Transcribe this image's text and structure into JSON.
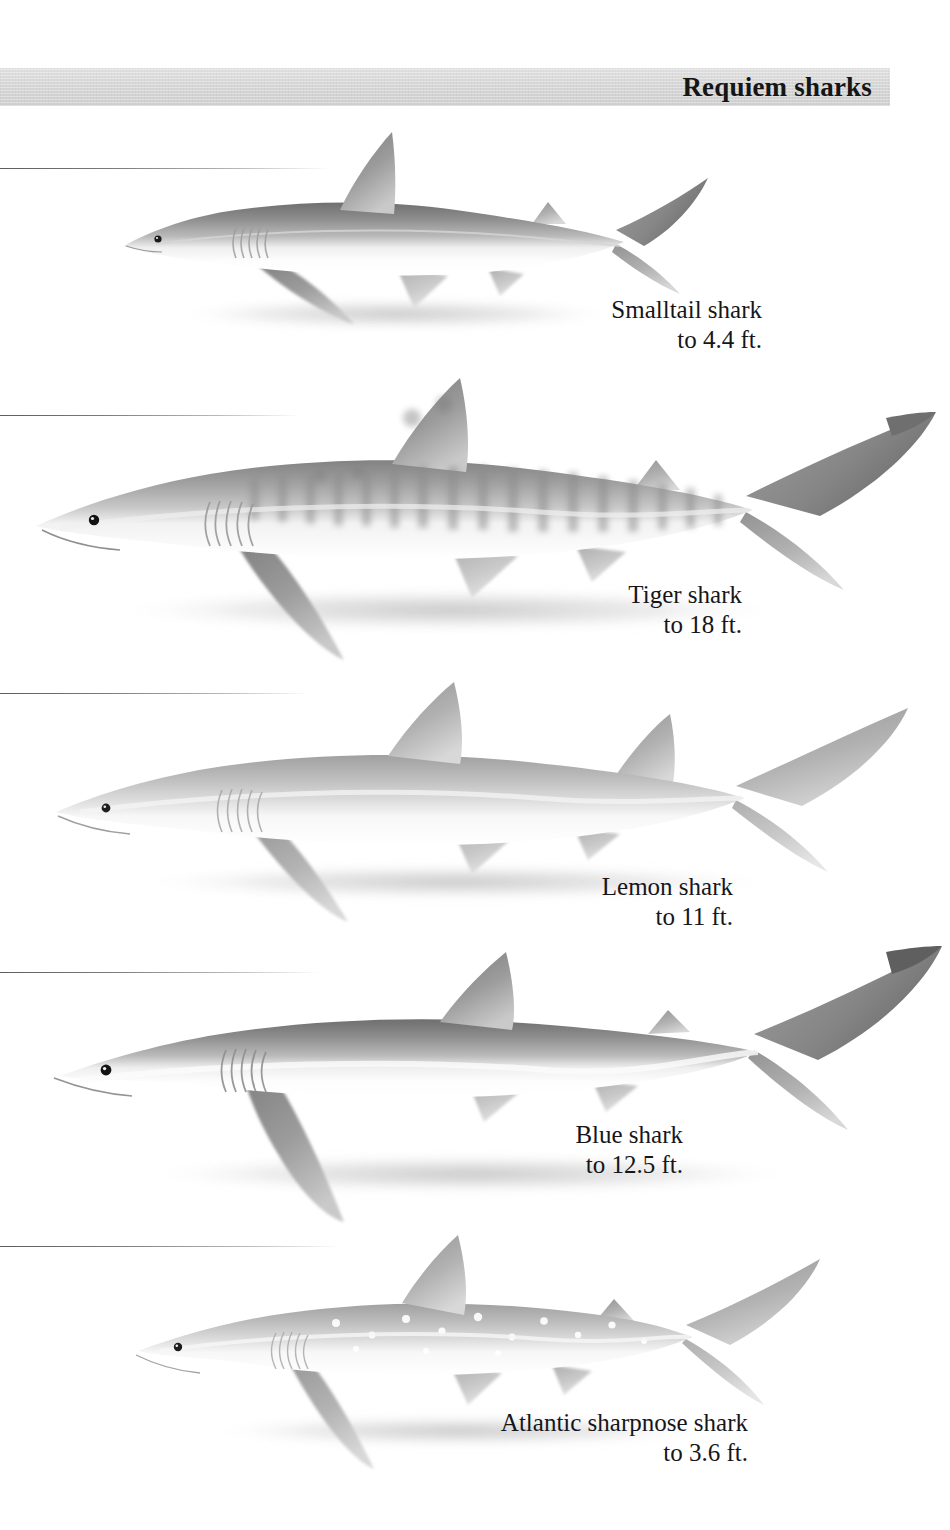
{
  "page": {
    "header_title": "Requiem sharks",
    "background_color": "#ffffff",
    "band_color": "#d6d6d6",
    "text_color": "#16161a",
    "rule_color": "#6a6a6a"
  },
  "plates": [
    {
      "id": "smalltail-shark",
      "name": "Smalltail shark",
      "size": "to 4.4 ft.",
      "rule_y": 168,
      "rule_width": 330,
      "caption_right": 762,
      "caption_top": 295,
      "figure": {
        "x": 96,
        "y": 118,
        "w": 600,
        "h": 220
      },
      "pattern": "plain",
      "body_tone": "#9a9a9a"
    },
    {
      "id": "tiger-shark",
      "name": "Tiger shark",
      "size": "to 18 ft.",
      "rule_y": 415,
      "rule_width": 300,
      "caption_right": 742,
      "caption_top": 580,
      "figure": {
        "x": 20,
        "y": 395,
        "w": 920,
        "h": 280
      },
      "pattern": "stripes",
      "body_tone": "#8f8f8f"
    },
    {
      "id": "lemon-shark",
      "name": "Lemon shark",
      "size": "to 11 ft.",
      "rule_y": 693,
      "rule_width": 310,
      "caption_right": 733,
      "caption_top": 872,
      "figure": {
        "x": 36,
        "y": 675,
        "w": 880,
        "h": 240
      },
      "pattern": "plain",
      "body_tone": "#b4b4b4"
    },
    {
      "id": "blue-shark",
      "name": "Blue shark",
      "size": "to 12.5 ft.",
      "rule_y": 972,
      "rule_width": 320,
      "caption_right": 683,
      "caption_top": 1120,
      "figure": {
        "x": 40,
        "y": 940,
        "w": 910,
        "h": 270
      },
      "pattern": "plain",
      "body_tone": "#8a8a8a"
    },
    {
      "id": "atlantic-sharpnose-shark",
      "name": "Atlantic sharpnose shark",
      "size": "to 3.6 ft.",
      "rule_y": 1246,
      "rule_width": 340,
      "caption_right": 748,
      "caption_top": 1408,
      "figure": {
        "x": 120,
        "y": 1230,
        "w": 700,
        "h": 230
      },
      "pattern": "spots",
      "body_tone": "#a8a8a8"
    }
  ]
}
